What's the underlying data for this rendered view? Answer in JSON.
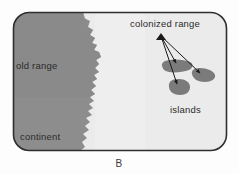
{
  "figure": {
    "panel_letter": "B",
    "labels": {
      "old_range": "old range",
      "continent": "continent",
      "colonized_range": "colonized range",
      "islands": "islands"
    },
    "colors": {
      "ocean": "#ebebeb",
      "continent": "#8d8d8d",
      "old_range": "#8a8a8a",
      "island": "#7b7b7b",
      "frame_border": "#2f2f2f",
      "arrow": "#1a1a1a",
      "text": "#2b2b2b",
      "page_background": "#fdfdfd"
    },
    "frame": {
      "x": 13,
      "y": 12,
      "width": 214,
      "height": 139,
      "corner_radius": 16
    },
    "landmass": {
      "name": "continent-landmass",
      "description": "continent occupying left portion of panel with jagged coastline facing right",
      "fill": "#8d8d8d"
    },
    "islands": [
      {
        "id": "island-left",
        "cx": 176,
        "cy": 66,
        "rx": 16,
        "ry": 6
      },
      {
        "id": "island-right",
        "cx": 203,
        "cy": 75,
        "rx": 12,
        "ry": 7
      },
      {
        "id": "island-bottom",
        "cx": 179,
        "cy": 87,
        "rx": 11,
        "ry": 8
      }
    ],
    "arrows": {
      "origin": {
        "x": 161,
        "y": 36
      },
      "targets": [
        {
          "x": 176,
          "y": 64
        },
        {
          "x": 201,
          "y": 74
        },
        {
          "x": 177,
          "y": 85
        }
      ]
    },
    "label_positions": {
      "old_range": {
        "x": 16,
        "y": 69
      },
      "continent": {
        "x": 20,
        "y": 140
      },
      "colonized_range": {
        "x": 130,
        "y": 27
      },
      "islands": {
        "x": 170,
        "y": 113
      },
      "panel_letter": {
        "x": 119,
        "y": 167
      }
    }
  }
}
